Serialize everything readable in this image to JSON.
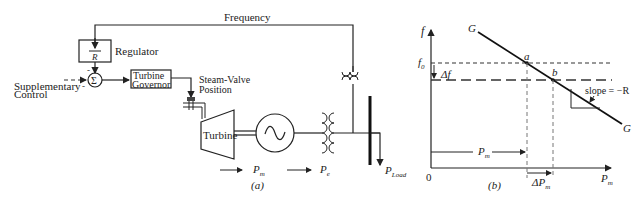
{
  "diagram_a": {
    "caption": "(a)",
    "frequency_label": "Frequency",
    "regulator": {
      "label": "Regulator",
      "symbol_num": "1",
      "symbol_den": "R"
    },
    "summer": {
      "symbol": "Σ",
      "sign_top": "-",
      "sign_left": "-"
    },
    "supplementary_control": {
      "line1": "Supplementary",
      "line2": "Control"
    },
    "turbine_governor": {
      "line1": "Turbine",
      "line2": "Governor"
    },
    "steam_valve": {
      "line1": "Steam-Valve",
      "line2": "Position"
    },
    "turbine": {
      "label": "Turbine"
    },
    "generator": {
      "symbol": "~"
    },
    "mechanical_power": {
      "base": "P",
      "sub": "m"
    },
    "electrical_power": {
      "base": "P",
      "sub": "e"
    },
    "load_power": {
      "base": "P",
      "sub": "Load"
    }
  },
  "diagram_b": {
    "caption": "(b)",
    "y_axis_label": "f",
    "x_axis_label": {
      "base": "P",
      "sub": "m"
    },
    "origin": "0",
    "f0_label": {
      "base": "f",
      "sub": "0"
    },
    "delta_f": "Δf",
    "line_label_top": "G",
    "line_label_bottom": "G",
    "point_a": "a",
    "point_b": "b",
    "slope_label": "slope = −R",
    "pm_arrow_label": {
      "base": "P",
      "sub": "m"
    },
    "delta_pm_label": {
      "base": "ΔP",
      "sub": "m"
    }
  }
}
